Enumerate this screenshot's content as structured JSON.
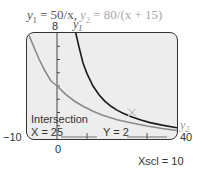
{
  "equation": {
    "y1_label": "y",
    "y1_sub": "1",
    "y1_expr": " = 50/x,",
    "y2_label": "y",
    "y2_sub": "2",
    "y2_expr": " = 80/(x + 15)"
  },
  "window": {
    "ymax_label": "8",
    "ymin_label": "0",
    "xmin_label": "−10",
    "xmax_label": "40",
    "xscl_label": "Xscl = 10"
  },
  "curve_labels": {
    "y1": "y",
    "y1_sub": "1",
    "y2": "y",
    "y2_sub": "2"
  },
  "result": {
    "title": "Intersection",
    "x_text": "X = 25",
    "y_text": "Y = 2"
  },
  "colors": {
    "y1_curve": "#1a1a1a",
    "y2_curve": "#8a8a8a",
    "screen_bg": "#ededed"
  }
}
